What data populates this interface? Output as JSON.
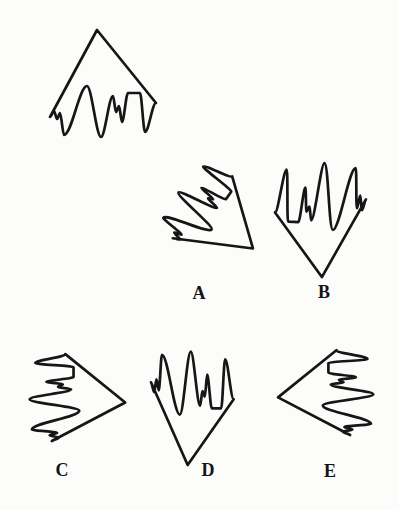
{
  "figure": {
    "kind": "mental rotation test item",
    "target": {
      "name": "target-shape",
      "orientation": "apex up, drips hanging down"
    },
    "options": [
      {
        "label": "A",
        "orientation": "apex down-right, mirrored, fingers up-left"
      },
      {
        "label": "B",
        "orientation": "apex down, rotated 180 degrees, fingers up"
      },
      {
        "label": "C",
        "orientation": "apex right, mirrored, fingers left"
      },
      {
        "label": "D",
        "orientation": "apex down, mirrored (vertical flip), fingers up"
      },
      {
        "label": "E",
        "orientation": "apex left, rotated 270 degrees, fingers right"
      }
    ]
  },
  "colors": {
    "ink": "#161616",
    "background": "#fcfcfa"
  }
}
